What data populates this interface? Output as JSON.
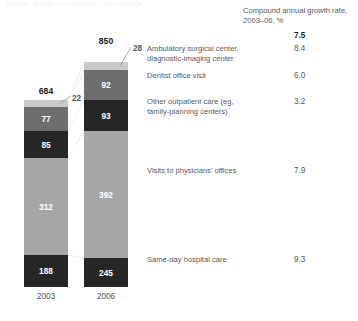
{
  "title_sliver": "Exhibit: growth in outpatient care settings",
  "header": {
    "cagr_label": "Compound annual growth rate, 2003–06, %"
  },
  "axis": {
    "years": [
      "2003",
      "2006"
    ]
  },
  "colors": {
    "light_gray": "#c9c9c9",
    "dark": "#262626",
    "mid_gray": "#6e6e6e",
    "grey": "#a6a6a6",
    "text": "#58585a"
  },
  "totals": {
    "y2003": "684",
    "y2006": "850",
    "cagr": "7.5"
  },
  "chart_data": {
    "type": "bar",
    "title": "Compound annual growth rate, 2003–06, %",
    "xlabel": "",
    "ylabel": "",
    "categories": [
      "2003",
      "2006"
    ],
    "stacked": true,
    "totals": [
      684,
      850
    ],
    "series": [
      {
        "name": "Ambulatory surgical center, diagnostic-imaging center",
        "values": [
          22,
          28
        ],
        "cagr": 8.4,
        "color": "#c9c9c9"
      },
      {
        "name": "Dentist office visit",
        "values": [
          77,
          92
        ],
        "cagr": 6.0,
        "color": "#6e6e6e"
      },
      {
        "name": "Other outpatient care (eg, family-planning centers)",
        "values": [
          85,
          93
        ],
        "cagr": 3.2,
        "color": "#262626"
      },
      {
        "name": "Visits to physicians’ offices",
        "values": [
          312,
          392
        ],
        "cagr": 7.9,
        "color": "#a6a6a6"
      },
      {
        "name": "Same-day hospital care",
        "values": [
          188,
          245
        ],
        "cagr": 9.3,
        "color": "#262626"
      }
    ],
    "total_cagr": 7.5,
    "legend_position": "right-labels",
    "grid": false
  },
  "rows": [
    {
      "label": "Ambulatory surgical center,\ndiagnostic-imaging center",
      "cagr": "8.4"
    },
    {
      "label": "Dentist office visit",
      "cagr": "6.0"
    },
    {
      "label": "Other outpatient care (eg,\nfamily-planning centers)",
      "cagr": "3.2"
    },
    {
      "label": "Visits to physicians’ offices",
      "cagr": "7.9"
    },
    {
      "label": "Same-day hospital care",
      "cagr": "9.3"
    }
  ],
  "segments_2003": [
    "22",
    "77",
    "85",
    "312",
    "188"
  ],
  "segments_2006": [
    "28",
    "92",
    "93",
    "392",
    "245"
  ]
}
